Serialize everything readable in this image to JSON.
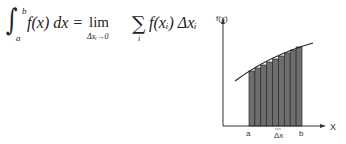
{
  "formula": {
    "integral_sign": "∫",
    "upper_limit": "b",
    "lower_limit": "a",
    "integrand": "f(x) dx =",
    "lim": "lim",
    "lim_subscript": "Δxᵢ→0",
    "sigma": "∑",
    "sigma_subscript": "i",
    "summand": "f(xᵢ) Δxᵢ"
  },
  "graph": {
    "y_axis_label": "f(x)",
    "x_axis_label": "X",
    "a_label": "a",
    "b_label": "b",
    "dx_label": "Δx",
    "bar_count": 9,
    "bar_color": "#6e6e6e",
    "axis_color": "#333333"
  },
  "chart_data": {
    "type": "bar",
    "xlabel": "X",
    "ylabel": "f(x)",
    "tick_labels": [
      "a",
      "Δx",
      "b"
    ],
    "categories": [
      "1",
      "2",
      "3",
      "4",
      "5",
      "6",
      "7",
      "8",
      "9"
    ],
    "values": [
      55,
      60,
      64,
      67,
      70,
      73,
      75,
      77,
      80
    ],
    "grid": false,
    "annotations": [
      "curve f(x) overlays bar tops",
      "Δx marks bar width"
    ]
  }
}
